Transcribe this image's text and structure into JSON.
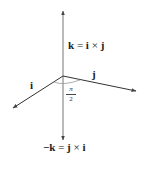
{
  "diagram": {
    "vectors": [
      {
        "name": "i",
        "label": "i",
        "direction": "front-left"
      },
      {
        "name": "j",
        "label": "j",
        "direction": "right"
      },
      {
        "name": "k",
        "label": "k = i × j",
        "direction": "up"
      },
      {
        "name": "-k",
        "label": "−k = j × i",
        "direction": "down"
      }
    ],
    "labels": {
      "k_label": {
        "lhs": "k",
        "eq": " = ",
        "a": "i",
        "times": " × ",
        "b": "j"
      },
      "negk_label": {
        "lhs": "−k",
        "eq": " = ",
        "a": "j",
        "times": " × ",
        "b": "i"
      },
      "i_label": "i",
      "j_label": "j",
      "angle_num": "π",
      "angle_den": "2"
    },
    "colors": {
      "axis": "#555555",
      "text": "#222222",
      "angle_arc": "#888888"
    }
  }
}
